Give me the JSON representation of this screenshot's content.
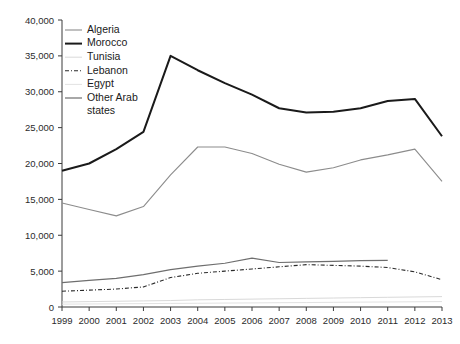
{
  "chart_data": {
    "type": "line",
    "title": "",
    "subtitle": "",
    "xlabel": "",
    "ylabel": "",
    "grid": false,
    "legend_position": "top-left",
    "xlim": [
      1999,
      2013
    ],
    "ylim": [
      0,
      40000
    ],
    "x": [
      1999,
      2000,
      2001,
      2002,
      2003,
      2004,
      2005,
      2006,
      2007,
      2008,
      2009,
      2010,
      2011,
      2012,
      2013
    ],
    "categories": [
      "1999",
      "2000",
      "2001",
      "2002",
      "2003",
      "2004",
      "2005",
      "2006",
      "2007",
      "2008",
      "2009",
      "2010",
      "2011",
      "2012",
      "2013"
    ],
    "ytick_labels": [
      "0",
      "5,000",
      "10,000",
      "15,000",
      "20,000",
      "25,000",
      "30,000",
      "35,000",
      "40,000"
    ],
    "ytick_values": [
      0,
      5000,
      10000,
      15000,
      20000,
      25000,
      30000,
      35000,
      40000
    ],
    "series": [
      {
        "name": "Algeria",
        "color": "#8c8c8c",
        "width": 1.1,
        "dash": "none",
        "values": [
          14500,
          13600,
          12700,
          14000,
          18400,
          22300,
          22300,
          21400,
          19900,
          18800,
          19400,
          20500,
          21200,
          22000,
          17500
        ]
      },
      {
        "name": "Morocco",
        "color": "#1a1a1a",
        "width": 2.0,
        "dash": "none",
        "values": [
          19000,
          20000,
          22000,
          24400,
          35000,
          33000,
          31200,
          29600,
          27700,
          27100,
          27200,
          27700,
          28700,
          29000,
          23800
        ]
      },
      {
        "name": "Tunisia",
        "color": "#d9d9d9",
        "width": 1.0,
        "dash": "none",
        "values": [
          700,
          750,
          800,
          850,
          900,
          1000,
          1050,
          1100,
          1150,
          1200,
          1250,
          1300,
          1350,
          1400,
          1450
        ]
      },
      {
        "name": "Lebanon",
        "color": "#2b2b2b",
        "width": 1.1,
        "dash": "4 2 1 2",
        "values": [
          2200,
          2350,
          2500,
          2800,
          4100,
          4700,
          5000,
          5300,
          5600,
          5900,
          5800,
          5700,
          5500,
          4900,
          3800
        ]
      },
      {
        "name": "Egypt",
        "color": "#e2e2e2",
        "width": 1.0,
        "dash": "none",
        "values": [
          400,
          420,
          450,
          470,
          500,
          520,
          550,
          570,
          600,
          620,
          650,
          680,
          700,
          730,
          760
        ]
      },
      {
        "name": "Other Arab states",
        "color": "#6e6e6e",
        "width": 1.2,
        "dash": "none",
        "values": [
          3400,
          3700,
          4000,
          4500,
          5200,
          5700,
          6100,
          6800,
          6200,
          6300,
          6350,
          6450,
          6500,
          null,
          null
        ]
      }
    ]
  },
  "legend": {
    "items": [
      {
        "label": "Algeria",
        "swatch": "thin-gray-line"
      },
      {
        "label": "Morocco",
        "swatch": "thick-black-line"
      },
      {
        "label": "Tunisia",
        "swatch": "very-light-gray-line"
      },
      {
        "label": "Lebanon",
        "swatch": "dash-dot-line"
      },
      {
        "label": "Egypt",
        "swatch": "light-gray-line"
      },
      {
        "label": "Other Arab",
        "swatch": "medium-gray-line"
      },
      {
        "label": "states",
        "swatch": "none"
      }
    ]
  }
}
